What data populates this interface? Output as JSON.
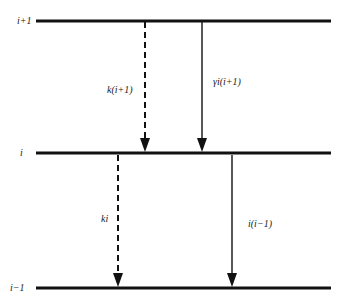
{
  "levels": [
    {
      "id": "upper",
      "label": "i+1"
    },
    {
      "id": "middle",
      "label": "i"
    },
    {
      "id": "lower",
      "label": "i−1"
    }
  ],
  "transitions": [
    {
      "id": "k-upper",
      "label": "k(i+1)",
      "style": "dashed",
      "from": "upper",
      "to": "middle"
    },
    {
      "id": "gamma-upper",
      "label": "γi(i+1)",
      "style": "solid",
      "from": "upper",
      "to": "middle"
    },
    {
      "id": "k-middle",
      "label": "ki",
      "style": "dashed",
      "from": "middle",
      "to": "lower"
    },
    {
      "id": "gamma-middle",
      "label": "i(i−1)",
      "style": "solid",
      "from": "middle",
      "to": "lower"
    }
  ]
}
